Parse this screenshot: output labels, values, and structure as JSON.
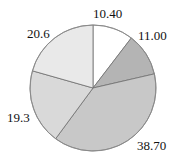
{
  "chart_data": {
    "type": "pie",
    "title": "",
    "start_angle_deg_from_top": 0,
    "direction": "clockwise",
    "slices": [
      {
        "label": "10.40",
        "value": 10.4,
        "color": "#ffffff"
      },
      {
        "label": "11.00",
        "value": 11.0,
        "color": "#b4b4b4"
      },
      {
        "label": "38.70",
        "value": 38.7,
        "color": "#c8c8c8"
      },
      {
        "label": "19.3",
        "value": 19.3,
        "color": "#d9d9d9"
      },
      {
        "label": "20.6",
        "value": 20.6,
        "color": "#e9e9e9"
      }
    ],
    "legend": null,
    "data_labels": true
  },
  "labels": [
    "10.40",
    "11.00",
    "38.70",
    "19.3",
    "20.6"
  ]
}
